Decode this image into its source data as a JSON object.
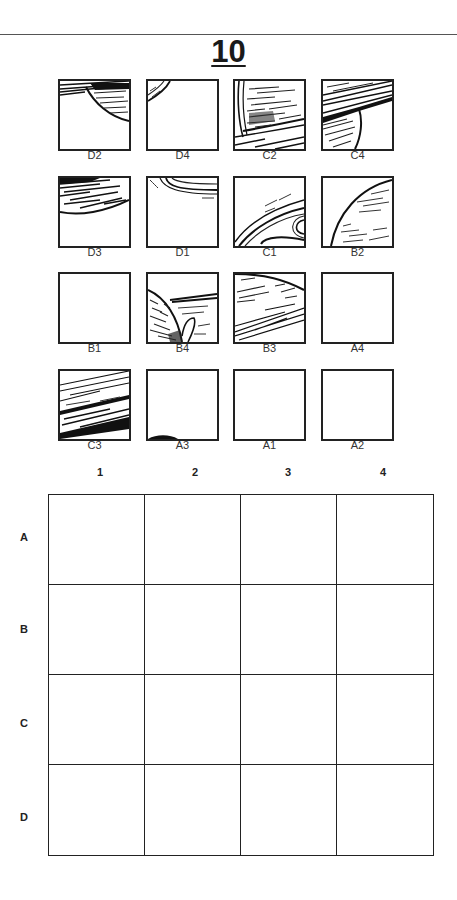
{
  "page": {
    "title": "10"
  },
  "pieces": [
    {
      "label": "D2",
      "art": "top-band-arc"
    },
    {
      "label": "D4",
      "art": "corner-arc-small"
    },
    {
      "label": "C2",
      "art": "planet-body-ring"
    },
    {
      "label": "C4",
      "art": "ring-diagonal"
    },
    {
      "label": "D3",
      "art": "top-shaded-arc"
    },
    {
      "label": "D1",
      "art": "top-ring-arcs"
    },
    {
      "label": "C1",
      "art": "ring-curves"
    },
    {
      "label": "B2",
      "art": "planet-edge-arc"
    },
    {
      "label": "B1",
      "art": "blank"
    },
    {
      "label": "B4",
      "art": "planet-ring-hook"
    },
    {
      "label": "B3",
      "art": "planet-body-streaks"
    },
    {
      "label": "A4",
      "art": "blank"
    },
    {
      "label": "C3",
      "art": "dense-ring-bands"
    },
    {
      "label": "A3",
      "art": "bottom-edge-mark"
    },
    {
      "label": "A1",
      "art": "blank"
    },
    {
      "label": "A2",
      "art": "blank"
    }
  ],
  "answer_grid": {
    "column_headers": [
      "1",
      "2",
      "3",
      "4"
    ],
    "row_headers": [
      "A",
      "B",
      "C",
      "D"
    ]
  }
}
